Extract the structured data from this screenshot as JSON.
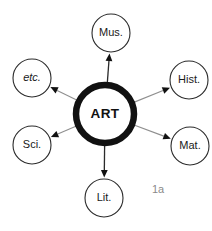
{
  "figure": {
    "caption": "1a",
    "center": {
      "label": "ART",
      "cx": 105,
      "cy": 114,
      "r": 29
    },
    "nodes": [
      {
        "id": "mus",
        "label": "Mus.",
        "cx": 111,
        "cy": 33,
        "r": 19,
        "italic": false
      },
      {
        "id": "hist",
        "label": "Hist.",
        "cx": 189,
        "cy": 80,
        "r": 19,
        "italic": false
      },
      {
        "id": "mat",
        "label": "Mat.",
        "cx": 190,
        "cy": 146,
        "r": 19,
        "italic": false
      },
      {
        "id": "lit",
        "label": "Lit.",
        "cx": 104,
        "cy": 198,
        "r": 19,
        "italic": false
      },
      {
        "id": "sci",
        "label": "Sci.",
        "cx": 32,
        "cy": 145,
        "r": 19,
        "italic": false
      },
      {
        "id": "etc",
        "label": "etc.",
        "cx": 32,
        "cy": 78,
        "r": 19,
        "italic": true
      }
    ],
    "edges": [
      {
        "id": "edge-mus",
        "from": "center",
        "to": "mus",
        "style": "dark"
      },
      {
        "id": "edge-hist",
        "from": "center",
        "to": "hist",
        "style": "light"
      },
      {
        "id": "edge-mat",
        "from": "center",
        "to": "mat",
        "style": "light"
      },
      {
        "id": "edge-lit",
        "from": "center",
        "to": "lit",
        "style": "dark"
      },
      {
        "id": "edge-sci",
        "from": "center",
        "to": "sci",
        "style": "light"
      },
      {
        "id": "edge-etc",
        "from": "center",
        "to": "etc",
        "style": "light"
      }
    ],
    "colors": {
      "background": "#ffffff",
      "center_stroke": "#111111",
      "node_stroke": "#2b2b2b",
      "connector": "#8f8f8f",
      "text": "#1a1a1a",
      "caption": "#8a8a8a"
    },
    "caption_position": {
      "x": 152,
      "y": 190
    }
  }
}
